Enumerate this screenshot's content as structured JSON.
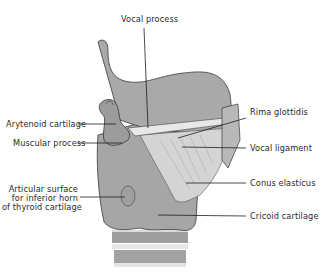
{
  "figure": {
    "colors": {
      "cartilage_fill": "#a9a9a9",
      "cartilage_dark": "#8c8c8c",
      "ligament_fill": "#d2d2d2",
      "outline": "#3a3a3a",
      "leader_line": "#1e1e1e",
      "label_text": "#2a2a2a",
      "background": "#ffffff"
    },
    "labels": {
      "vocal_process": "Vocal process",
      "arytenoid_cartilage": "Arytenoid cartilage",
      "muscular_process": "Muscular process",
      "articular_surface_line1": "Articular surface",
      "articular_surface_line2": "for inferior horn",
      "articular_surface_line3": "of thyroid cartilage",
      "rima_glottidis": "Rima glottidis",
      "vocal_ligament": "Vocal ligament",
      "conus_elasticus": "Conus elasticus",
      "cricoid_cartilage": "Cricoid cartilage"
    }
  }
}
